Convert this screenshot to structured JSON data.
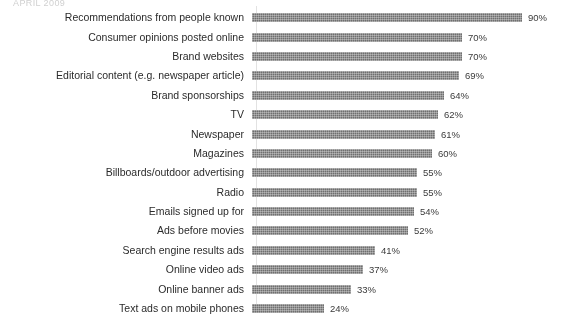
{
  "header": {
    "text": "APRIL 2009"
  },
  "chart_data": {
    "type": "bar",
    "orientation": "horizontal",
    "title": "APRIL 2009",
    "xlabel": "",
    "ylabel": "",
    "xlim": [
      0,
      100
    ],
    "grid": false,
    "legend": false,
    "value_suffix": "%",
    "bar_color": "#6f6f6f",
    "background_color": "#ffffff",
    "categories": [
      "Recommendations from people known",
      "Consumer opinions posted online",
      "Brand websites",
      "Editorial content (e.g. newspaper article)",
      "Brand sponsorships",
      "TV",
      "Newspaper",
      "Magazines",
      "Billboards/outdoor advertising",
      "Radio",
      "Emails signed up for",
      "Ads before movies",
      "Search engine results ads",
      "Online video ads",
      "Online banner ads",
      "Text ads on mobile phones"
    ],
    "values": [
      90,
      70,
      70,
      69,
      64,
      62,
      61,
      60,
      55,
      55,
      54,
      52,
      41,
      37,
      33,
      24
    ],
    "value_labels": [
      "90%",
      "70%",
      "70%",
      "69%",
      "64%",
      "62%",
      "61%",
      "60%",
      "55%",
      "55%",
      "54%",
      "52%",
      "41%",
      "37%",
      "33%",
      "24%"
    ],
    "rows": [
      {
        "label": "Recommendations from people known",
        "value": 90,
        "value_label": "90%"
      },
      {
        "label": "Consumer opinions posted online",
        "value": 70,
        "value_label": "70%"
      },
      {
        "label": "Brand websites",
        "value": 70,
        "value_label": "70%"
      },
      {
        "label": "Editorial content (e.g. newspaper article)",
        "value": 69,
        "value_label": "69%"
      },
      {
        "label": "Brand sponsorships",
        "value": 64,
        "value_label": "64%"
      },
      {
        "label": "TV",
        "value": 62,
        "value_label": "62%"
      },
      {
        "label": "Newspaper",
        "value": 61,
        "value_label": "61%"
      },
      {
        "label": "Magazines",
        "value": 60,
        "value_label": "60%"
      },
      {
        "label": "Billboards/outdoor advertising",
        "value": 55,
        "value_label": "55%"
      },
      {
        "label": "Radio",
        "value": 55,
        "value_label": "55%"
      },
      {
        "label": "Emails signed up for",
        "value": 54,
        "value_label": "54%"
      },
      {
        "label": "Ads before movies",
        "value": 52,
        "value_label": "52%"
      },
      {
        "label": "Search engine results ads",
        "value": 41,
        "value_label": "41%"
      },
      {
        "label": "Online video ads",
        "value": 37,
        "value_label": "37%"
      },
      {
        "label": "Online banner ads",
        "value": 33,
        "value_label": "33%"
      },
      {
        "label": "Text ads on mobile phones",
        "value": 24,
        "value_label": "24%"
      }
    ]
  }
}
